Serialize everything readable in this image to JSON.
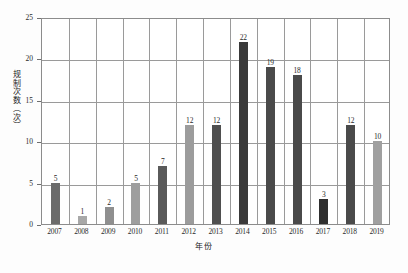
{
  "chart_data": {
    "type": "bar",
    "title": "",
    "xlabel": "年份",
    "ylabel": "regulation-count-axis",
    "ylabel_text": "规制次数（次）",
    "categories": [
      "2007",
      "2008",
      "2009",
      "2010",
      "2011",
      "2012",
      "2013",
      "2014",
      "2015",
      "2016",
      "2017",
      "2018",
      "2019"
    ],
    "values": [
      5,
      1,
      2,
      5,
      7,
      12,
      12,
      22,
      19,
      18,
      3,
      12,
      10
    ],
    "bar_colors": [
      "#6b6b6b",
      "#a8a8a8",
      "#8f8f8f",
      "#9e9e9e",
      "#5a5a5a",
      "#9c9c9c",
      "#4f4f4f",
      "#3a3a3a",
      "#4a4a4a",
      "#4a4a4a",
      "#2f2f2f",
      "#4a4a4a",
      "#a0a0a0"
    ],
    "ylim": [
      0,
      25
    ],
    "yticks": [
      "0",
      "5",
      "10",
      "15",
      "20",
      "25"
    ],
    "ytick_values": [
      0,
      5,
      10,
      15,
      20,
      25
    ],
    "grid": true,
    "grid_vertical": true,
    "legend": "none",
    "data_labels": true,
    "plot_border_color": "#8c8c8c",
    "grid_color": "#9a9a9a",
    "label_color": "#2a2a2a"
  }
}
